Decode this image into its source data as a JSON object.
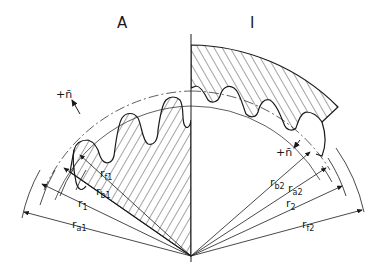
{
  "diagram": {
    "type": "gear-mesh-cross-section",
    "panels": [
      {
        "id": "left",
        "label": "A",
        "description": "external gear"
      },
      {
        "id": "right",
        "label": "I",
        "description": "internal gear"
      }
    ],
    "normal_labels": {
      "left": "+n̄",
      "right": "+n̄"
    },
    "left_radii": [
      {
        "symbol": "r",
        "sub": "f1"
      },
      {
        "symbol": "r",
        "sub": "b1"
      },
      {
        "symbol": "r",
        "sub": "1"
      },
      {
        "symbol": "r",
        "sub": "a1"
      }
    ],
    "right_radii": [
      {
        "symbol": "r",
        "sub": "b2"
      },
      {
        "symbol": "r",
        "sub": "a2"
      },
      {
        "symbol": "r",
        "sub": "2"
      },
      {
        "symbol": "r",
        "sub": "f2"
      }
    ],
    "colors": {
      "line": "#1a1a1a",
      "background": "#ffffff"
    }
  }
}
